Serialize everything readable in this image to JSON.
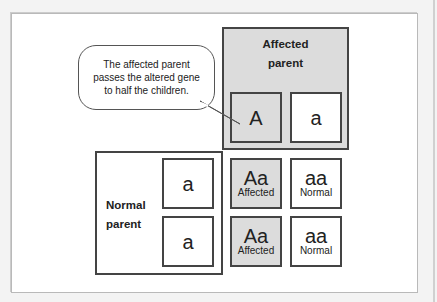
{
  "callout": {
    "lines": [
      "The affected parent",
      "passes the altered gene",
      "to half the children."
    ]
  },
  "affected_parent": {
    "title_line1": "Affected",
    "title_line2": "parent",
    "alleles": [
      "A",
      "a"
    ]
  },
  "normal_parent": {
    "title_line1": "Normal",
    "title_line2": "parent",
    "alleles": [
      "a",
      "a"
    ]
  },
  "offspring": [
    {
      "genotype": "Aa",
      "phenotype": "Affected"
    },
    {
      "genotype": "aa",
      "phenotype": "Normal"
    },
    {
      "genotype": "Aa",
      "phenotype": "Affected"
    },
    {
      "genotype": "aa",
      "phenotype": "Normal"
    }
  ],
  "colors": {
    "affected_fill": "#dcdcdc",
    "normal_fill": "#ffffff",
    "border": "#444444"
  }
}
